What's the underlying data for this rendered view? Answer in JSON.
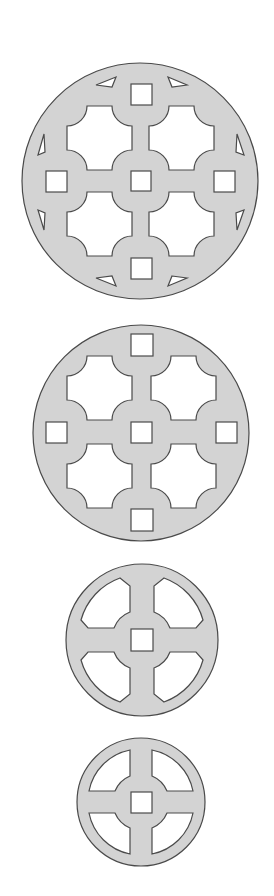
{
  "diagram": {
    "title": "",
    "background": "#ffffff",
    "fill_color": "#d3d3d3",
    "stroke_color": "#4a4a4a",
    "figures": [
      {
        "id": "pattern-1",
        "type": "circular-grille",
        "center": [
          140,
          181
        ],
        "radius": 118,
        "cutouts": {
          "octagons": 4,
          "squares": 5,
          "triangles": 8
        }
      },
      {
        "id": "pattern-2",
        "type": "circular-grille",
        "center": [
          141,
          433
        ],
        "radius": 108,
        "cutouts": {
          "octagons": 4,
          "squares": 5,
          "triangles": 0
        }
      },
      {
        "id": "pattern-3",
        "type": "spoked-wheel-chamfered",
        "center": [
          142,
          640
        ],
        "radius": 76,
        "cutouts": {
          "quadrants": 4,
          "squares": 1
        }
      },
      {
        "id": "pattern-4",
        "type": "spoked-wheel",
        "center": [
          141,
          802
        ],
        "radius": 64,
        "cutouts": {
          "quadrants": 4,
          "squares": 1
        }
      }
    ]
  }
}
